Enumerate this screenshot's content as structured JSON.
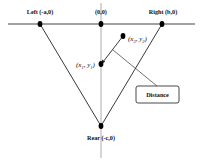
{
  "diagram": {
    "colors": {
      "background": "#ffffff",
      "line": "#222222",
      "axis": "#777777",
      "dot": "#000000",
      "box_border": "#333333"
    },
    "points": {
      "left": {
        "label": "Left (-a,0)",
        "x": 40,
        "y": 24
      },
      "origin": {
        "label": "(0,0)",
        "x": 101,
        "y": 24
      },
      "right": {
        "label": "Right (b,0)",
        "x": 162,
        "y": 24
      },
      "rear": {
        "label": "Rear (-c,0)",
        "x": 101,
        "y": 126
      },
      "p1": {
        "label": "(x1, y1)",
        "label_base": "x",
        "label_base2": "y",
        "sub": "1",
        "x": 101,
        "y": 64
      },
      "p2": {
        "label": "(x2, y2)",
        "label_base": "x",
        "label_base2": "y",
        "sub": "2",
        "x": 123,
        "y": 36
      }
    },
    "callout": {
      "label": "Distance"
    }
  }
}
